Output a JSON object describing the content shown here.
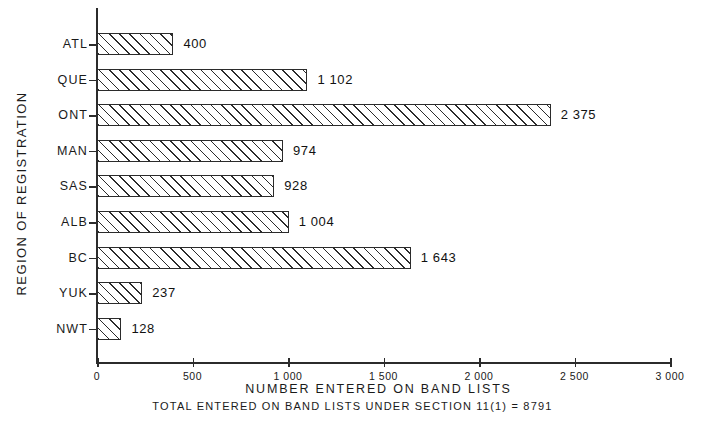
{
  "chart_data": {
    "type": "bar",
    "orientation": "horizontal",
    "title": "",
    "xlabel": "NUMBER ENTERED ON BAND LISTS",
    "ylabel": "REGION OF REGISTRATION",
    "categories": [
      "ATL",
      "QUE",
      "ONT",
      "MAN",
      "SAS",
      "ALB",
      "BC",
      "YUK",
      "NWT"
    ],
    "values": [
      400,
      1102,
      2375,
      974,
      928,
      1004,
      1643,
      237,
      128
    ],
    "value_labels": [
      "400",
      "1 102",
      "2 375",
      "974",
      "928",
      "1 004",
      "1 643",
      "237",
      "128"
    ],
    "xlim": [
      0,
      3000
    ],
    "xticks": [
      0,
      500,
      1000,
      1500,
      2000,
      2500,
      3000
    ],
    "xtick_labels": [
      "0",
      "500",
      "1 000",
      "1 500",
      "2 000",
      "2 500",
      "3 000"
    ],
    "grid": false,
    "legend": null,
    "bar_style": "diagonal-hatch",
    "annotation": "TOTAL ENTERED ON BAND LISTS UNDER SECTION 11(1) = 8791"
  },
  "colors": {
    "ink": "#2b2b2b",
    "background": "#ffffff"
  }
}
